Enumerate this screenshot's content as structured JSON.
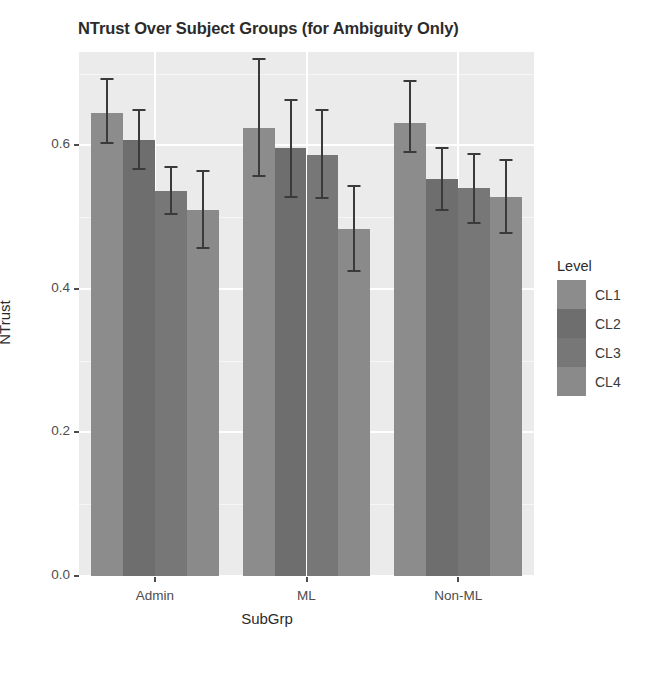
{
  "chart_data": {
    "type": "bar",
    "title": "NTrust Over Subject Groups (for Ambiguity Only)",
    "xlabel": "SubGrp",
    "ylabel": "NTrust",
    "categories": [
      "Admin",
      "ML",
      "Non-ML"
    ],
    "ylim": [
      0.0,
      0.73
    ],
    "ytick_labels": [
      "0.0",
      "0.2",
      "0.4",
      "0.6"
    ],
    "ytick_values": [
      0.0,
      0.2,
      0.4,
      0.6
    ],
    "grid": true,
    "legend_position": "right",
    "legend_title": "Level",
    "error_bars": "symmetric",
    "series": [
      {
        "name": "CL1",
        "color": "#8c8c8c",
        "values": [
          0.645,
          0.624,
          0.631
        ],
        "err_low": [
          0.602,
          0.556,
          0.589
        ],
        "err_high": [
          0.694,
          0.722,
          0.691
        ]
      },
      {
        "name": "CL2",
        "color": "#6e6e6e",
        "values": [
          0.608,
          0.596,
          0.553
        ],
        "err_low": [
          0.565,
          0.527,
          0.508
        ],
        "err_high": [
          0.651,
          0.665,
          0.598
        ]
      },
      {
        "name": "CL3",
        "color": "#777777",
        "values": [
          0.537,
          0.587,
          0.54
        ],
        "err_low": [
          0.503,
          0.525,
          0.491
        ],
        "err_high": [
          0.571,
          0.65,
          0.589
        ]
      },
      {
        "name": "CL4",
        "color": "#8a8a8a",
        "values": [
          0.51,
          0.484,
          0.528
        ],
        "err_low": [
          0.455,
          0.424,
          0.476
        ],
        "err_high": [
          0.565,
          0.545,
          0.581
        ]
      }
    ]
  },
  "legend": {
    "title": "Level",
    "items": [
      {
        "label": "CL1",
        "color": "#8c8c8c"
      },
      {
        "label": "CL2",
        "color": "#6e6e6e"
      },
      {
        "label": "CL3",
        "color": "#777777"
      },
      {
        "label": "CL4",
        "color": "#8a8a8a"
      }
    ]
  },
  "theme": {
    "panel_background": "#ebebeb",
    "grid_major_color": "#ffffff",
    "grid_minor_color": "#f6f6f6",
    "text_color": "#4d4d4d",
    "errorbar_color": "#3a3a3a",
    "plot_background": "#ffffff"
  }
}
